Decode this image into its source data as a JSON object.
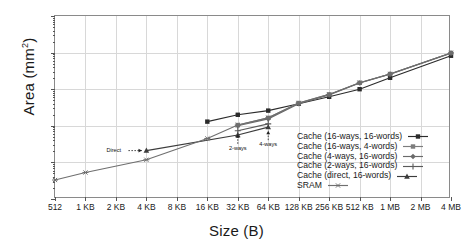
{
  "chart_data": {
    "type": "line",
    "title": "",
    "xlabel": "Size (B)",
    "ylabel": "Area (mm²)",
    "ylabel_text": "Area (mm",
    "ylabel_sup": "2",
    "ylabel_tail": ")",
    "xscale": "log2",
    "yscale": "log10",
    "ylim": [
      0.001,
      100
    ],
    "grid": true,
    "legend_position": "lower-right-inside",
    "categories": [
      "512",
      "1 KB",
      "2 KB",
      "4 KB",
      "8 KB",
      "16 KB",
      "32 KB",
      "64 KB",
      "128 KB",
      "256 KB",
      "512 KB",
      "1 MB",
      "2 MB",
      "4 MB"
    ],
    "yticks": [
      "0.001",
      "0.01",
      "0.1",
      "1",
      "10",
      "100"
    ],
    "ytick_values": [
      0.001,
      0.01,
      0.1,
      1,
      10,
      100
    ],
    "series": [
      {
        "name": "Cache (16-ways, 16-words)",
        "color": "#2b2b2b",
        "marker": "filled-square",
        "x": [
          "16 KB",
          "32 KB",
          "64 KB",
          "128 KB",
          "256 KB",
          "512 KB",
          "1 MB",
          "4 MB"
        ],
        "values": [
          0.13,
          0.2,
          0.26,
          0.4,
          0.62,
          1.0,
          2.05,
          8.2
        ]
      },
      {
        "name": "Cache (16-ways, 4-words)",
        "color": "#7d7d7d",
        "marker": "filled-square-gray",
        "x": [
          "32 KB",
          "64 KB",
          "128 KB",
          "256 KB",
          "512 KB",
          "1 MB",
          "4 MB"
        ],
        "values": [
          0.105,
          0.165,
          0.42,
          0.72,
          1.5,
          2.6,
          9.8
        ]
      },
      {
        "name": "Cache (4-ways, 16-words)",
        "color": "#6a6a6a",
        "marker": "diamond",
        "x": [
          "32 KB",
          "64 KB",
          "128 KB",
          "256 KB",
          "512 KB",
          "1 MB",
          "4 MB"
        ],
        "values": [
          0.1,
          0.155,
          0.4,
          0.7,
          1.48,
          2.58,
          9.7
        ]
      },
      {
        "name": "Cache (2-ways, 16-words)",
        "color": "#5a5a5a",
        "marker": "plus",
        "x": [
          "32 KB",
          "64 KB"
        ],
        "values": [
          0.073,
          0.113
        ]
      },
      {
        "name": "Cache (direct, 16-words)",
        "color": "#3c3c3c",
        "marker": "triangle",
        "x": [
          "4 KB",
          "32 KB",
          "64 KB"
        ],
        "values": [
          0.021,
          0.056,
          0.092
        ]
      },
      {
        "name": "SRAM",
        "color": "#6f6f6f",
        "marker": "asterisk",
        "x": [
          "512",
          "1 KB",
          "4 KB",
          "16 KB",
          "32 KB",
          "64 KB",
          "128 KB",
          "256 KB",
          "512 KB",
          "1 MB",
          "4 MB"
        ],
        "values": [
          0.0033,
          0.0053,
          0.0118,
          0.045,
          0.105,
          0.165,
          0.42,
          0.72,
          1.5,
          2.6,
          9.8
        ]
      }
    ],
    "annotations": [
      {
        "label": "Direct",
        "at_x": "4 KB",
        "style": "dashed-arrow-right"
      },
      {
        "label": "2-ways",
        "at_x": "32 KB",
        "style": "dashed-arrow-up"
      },
      {
        "label": "4-ways",
        "at_x": "64 KB",
        "style": "dashed-arrow-up"
      }
    ]
  },
  "legend": {
    "items": [
      {
        "label": "Cache (16-ways, 16-words)"
      },
      {
        "label": "Cache (16-ways, 4-words)"
      },
      {
        "label": "Cache (4-ways, 16-words)"
      },
      {
        "label": "Cache (2-ways, 16-words)"
      },
      {
        "label": "Cache (direct, 16-words)"
      },
      {
        "label": "SRAM"
      }
    ]
  },
  "colors": {
    "frame": "#8a8a8a",
    "grid": "#d8d8d8",
    "background": "#ffffff",
    "text": "#1a1a1a"
  }
}
